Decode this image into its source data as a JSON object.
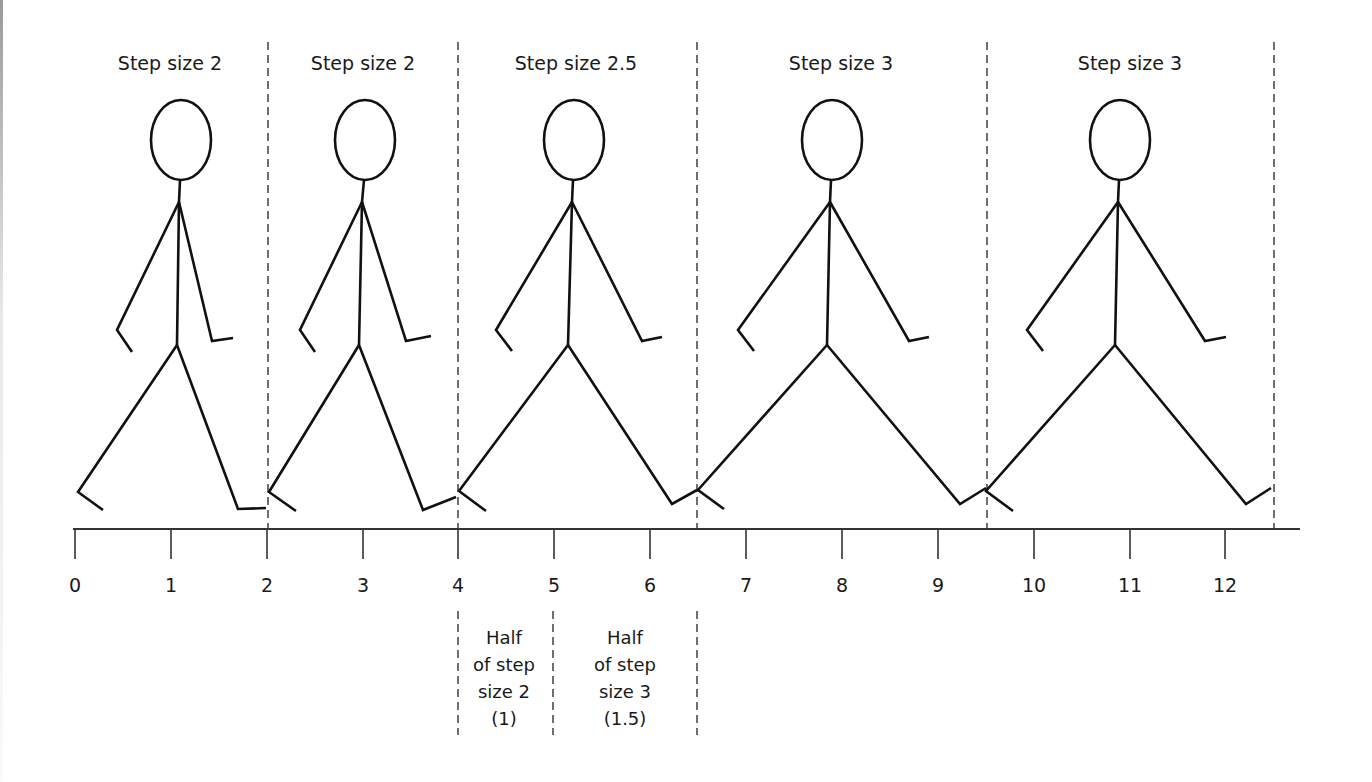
{
  "diagram": {
    "title": "",
    "step_labels": [
      "Step size 2",
      "Step size 2",
      "Step size 2.5",
      "Step size 3",
      "Step size 3"
    ],
    "figures": [
      {
        "label": "Step size 2",
        "start": 0,
        "end": 2,
        "center": 1.1
      },
      {
        "label": "Step size 2",
        "start": 2,
        "end": 4,
        "center": 3.0
      },
      {
        "label": "Step size 2.5",
        "start": 4,
        "end": 6.5,
        "center": 5.2
      },
      {
        "label": "Step size 3",
        "start": 6.5,
        "end": 9.5,
        "center": 7.9
      },
      {
        "label": "Step size 3",
        "start": 9.5,
        "end": 12.5,
        "center": 10.9
      }
    ],
    "axis": {
      "ticks": [
        "0",
        "1",
        "2",
        "3",
        "4",
        "5",
        "6",
        "7",
        "8",
        "9",
        "10",
        "11",
        "12"
      ],
      "range": [
        0,
        12.5
      ]
    },
    "boundary_positions": [
      2,
      4,
      6.5,
      9.5,
      12.5
    ],
    "annotations": [
      {
        "lines": [
          "Half",
          "of step",
          "size 2",
          "(1)"
        ],
        "from": 4,
        "to": 5
      },
      {
        "lines": [
          "Half",
          "of step",
          "size 3",
          "(1.5)"
        ],
        "from": 5,
        "to": 6.5
      }
    ]
  }
}
